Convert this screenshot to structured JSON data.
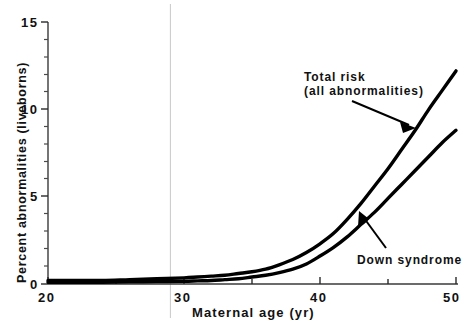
{
  "chart_data": {
    "type": "line",
    "title": "",
    "subtitle": "",
    "xlabel": "Maternal age (yr)",
    "ylabel": "Percent abnormalities (liveborns)",
    "xlim": [
      20,
      50
    ],
    "ylim": [
      0,
      15
    ],
    "x_major_ticks": [
      20,
      30,
      40,
      50
    ],
    "x_tick_labels": [
      "20",
      "30",
      "40",
      "50"
    ],
    "x_minor_tick_step": 5,
    "y_major_ticks": [
      0,
      5,
      10,
      15
    ],
    "y_tick_labels": [
      "0",
      "5",
      "10",
      "15"
    ],
    "y_minor_tick_step": 1,
    "grid": "single faint vertical gridline near age 29",
    "gridline_x": 29,
    "legend_position": "inline annotations with leader arrows",
    "line_color": "#000000",
    "line_width_px": 3,
    "x": [
      20,
      22,
      24,
      26,
      28,
      30,
      31,
      32,
      33,
      34,
      35,
      36,
      37,
      38,
      39,
      40,
      41,
      42,
      43,
      44,
      45,
      46,
      47,
      48,
      49,
      50
    ],
    "series": [
      {
        "name": "Total risk (all abnormalities)",
        "annotation_lines": [
          "Total risk",
          "(all abnormalities)"
        ],
        "values": [
          0.2,
          0.2,
          0.2,
          0.25,
          0.3,
          0.35,
          0.4,
          0.45,
          0.5,
          0.6,
          0.7,
          0.85,
          1.1,
          1.4,
          1.8,
          2.3,
          2.9,
          3.7,
          4.6,
          5.6,
          6.6,
          7.7,
          8.8,
          10.0,
          11.1,
          12.2
        ]
      },
      {
        "name": "Down syndrome",
        "annotation_lines": [
          "Down syndrome"
        ],
        "values": [
          0.1,
          0.1,
          0.1,
          0.12,
          0.14,
          0.16,
          0.18,
          0.2,
          0.25,
          0.3,
          0.4,
          0.5,
          0.65,
          0.85,
          1.15,
          1.6,
          2.1,
          2.7,
          3.4,
          4.1,
          4.9,
          5.7,
          6.5,
          7.3,
          8.1,
          8.8
        ]
      }
    ],
    "annotations": [
      {
        "id": "total-risk-annotation",
        "lines": [
          "Total risk",
          "(all abnormalities)"
        ],
        "arrow": "points down-right to upper curve"
      },
      {
        "id": "down-syndrome-annotation",
        "lines": [
          "Down syndrome"
        ],
        "arrow": "points up-left to lower curve"
      }
    ]
  }
}
